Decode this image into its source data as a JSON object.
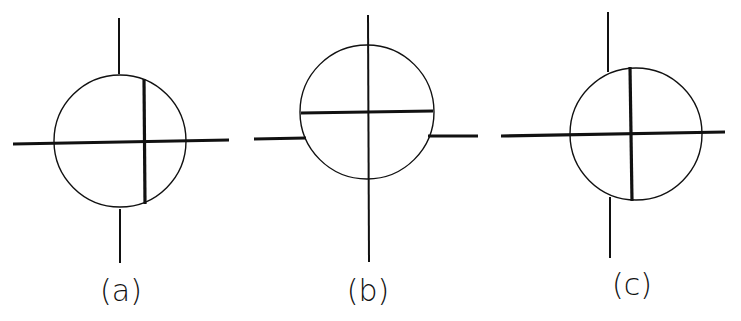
{
  "figure": {
    "stroke_color": "#111111",
    "background": "#ffffff",
    "panels": [
      {
        "id": "a",
        "label": "(a)",
        "label_pos": [
          121,
          301
        ],
        "circle": {
          "cx": 120,
          "cy": 141,
          "r": 66
        },
        "thin_lines": [
          {
            "x1": 119,
            "y1": 18,
            "x2": 119,
            "y2": 74
          },
          {
            "x1": 120,
            "y1": 209,
            "x2": 120,
            "y2": 263
          }
        ],
        "thick_lines": [
          {
            "x1": 13,
            "y1": 144,
            "x2": 229,
            "y2": 140
          },
          {
            "x1": 144,
            "y1": 79,
            "x2": 145,
            "y2": 204
          }
        ]
      },
      {
        "id": "b",
        "label": "(b)",
        "label_pos": [
          368,
          301
        ],
        "circle": {
          "cx": 367,
          "cy": 112,
          "r": 67
        },
        "thin_lines": [
          {
            "x1": 368,
            "y1": 15,
            "x2": 369,
            "y2": 262
          }
        ],
        "thick_lines": [
          {
            "x1": 301,
            "y1": 113,
            "x2": 433,
            "y2": 111
          },
          {
            "x1": 254,
            "y1": 139,
            "x2": 306,
            "y2": 138
          },
          {
            "x1": 428,
            "y1": 136,
            "x2": 478,
            "y2": 136
          }
        ]
      },
      {
        "id": "c",
        "label": "(c)",
        "label_pos": [
          632,
          295
        ],
        "circle": {
          "cx": 636,
          "cy": 134,
          "r": 66
        },
        "thin_lines": [
          {
            "x1": 608,
            "y1": 12,
            "x2": 608,
            "y2": 72
          },
          {
            "x1": 610,
            "y1": 197,
            "x2": 610,
            "y2": 258
          }
        ],
        "thick_lines": [
          {
            "x1": 501,
            "y1": 136,
            "x2": 725,
            "y2": 132
          },
          {
            "x1": 630,
            "y1": 67,
            "x2": 632,
            "y2": 201
          }
        ]
      }
    ]
  }
}
